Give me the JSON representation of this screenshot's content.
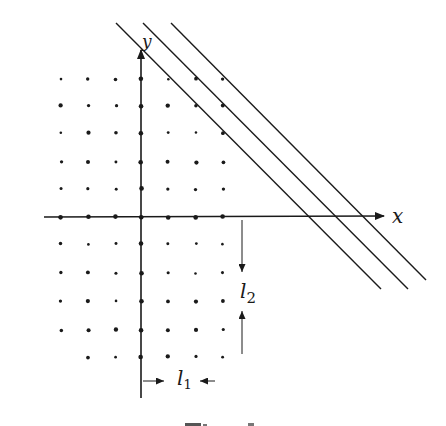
{
  "figure": {
    "type": "lattice-diagram",
    "axes": {
      "x_label": "x",
      "y_label": "y",
      "origin_px": [
        141,
        217
      ]
    },
    "lattice": {
      "columns_px": [
        61,
        88,
        116,
        141,
        168,
        196,
        223
      ],
      "rows_above_px": [
        79,
        106,
        133,
        162,
        189
      ],
      "axis_row_px": 217,
      "rows_below_px": [
        244,
        273,
        301,
        330,
        357
      ],
      "spacing_l1": 27,
      "spacing_l2": 28
    },
    "parallel_lines": [
      {
        "name": "line-1",
        "from": [
          116,
          23
        ],
        "to": [
          381,
          289
        ]
      },
      {
        "name": "line-2",
        "from": [
          143,
          23
        ],
        "to": [
          408,
          289
        ]
      },
      {
        "name": "line-3",
        "from": [
          171,
          23
        ],
        "to": [
          426,
          280
        ]
      }
    ],
    "dimensions": {
      "l1_label": "l",
      "l1_sub": "1",
      "l2_label": "l",
      "l2_sub": "2"
    },
    "colors": {
      "ink": "#1a1a1a",
      "background": "#ffffff"
    }
  }
}
